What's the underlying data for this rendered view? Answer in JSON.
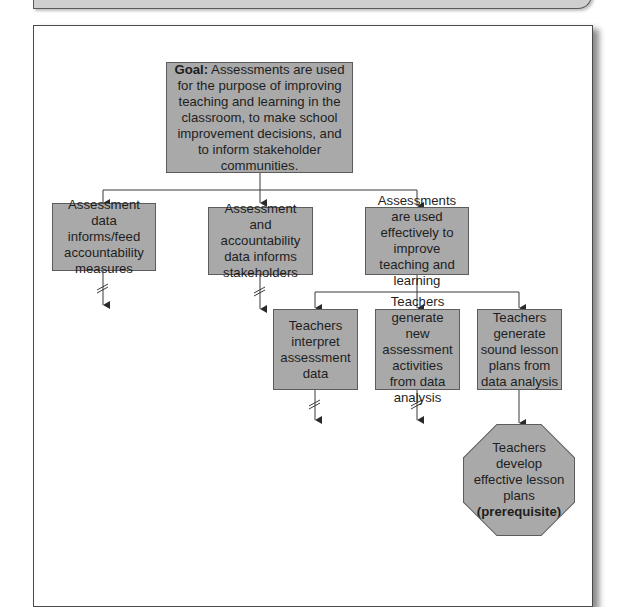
{
  "diagram": {
    "goal": {
      "label_bold": "Goal:",
      "text": " Assessments are used for the purpose of improving teaching and learning in the classroom, to make school improvement decisions, and to inform stakeholder communities."
    },
    "level2": [
      {
        "text": "Assessment data informs/feed accountability measures",
        "continues": true
      },
      {
        "text": "Assessment and accountability data informs stakeholders",
        "continues": true
      },
      {
        "text": "Assessments are used effectively to improve teaching and learning",
        "continues": false
      }
    ],
    "level3": [
      {
        "text": "Teachers interpret assessment data",
        "continues": true
      },
      {
        "text": "Teachers generate new assessment activities from data analysis",
        "continues": true
      },
      {
        "text": "Teachers generate sound lesson plans from data analysis",
        "continues": false
      }
    ],
    "prerequisite": {
      "text": "Teachers develop effective lesson plans",
      "label_bold": "(prerequisite)"
    }
  },
  "colors": {
    "box_fill": "#a9a9a9",
    "box_border": "#5c5c5c",
    "line": "#3a3a3a",
    "top_bar": "#cfcfcf"
  }
}
